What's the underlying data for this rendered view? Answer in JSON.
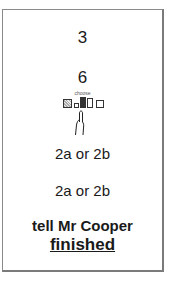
{
  "card": {
    "step_one": "3",
    "step_two": "6",
    "choose_label": "choose",
    "icons": [
      "textured-square-icon",
      "small-square-icon",
      "filled-tall-rect-icon",
      "tall-rect-icon",
      "square-icon"
    ],
    "option_a": "2a or 2b",
    "option_b": "2a or 2b",
    "instruction": "tell Mr Cooper",
    "final_word": "finished"
  }
}
